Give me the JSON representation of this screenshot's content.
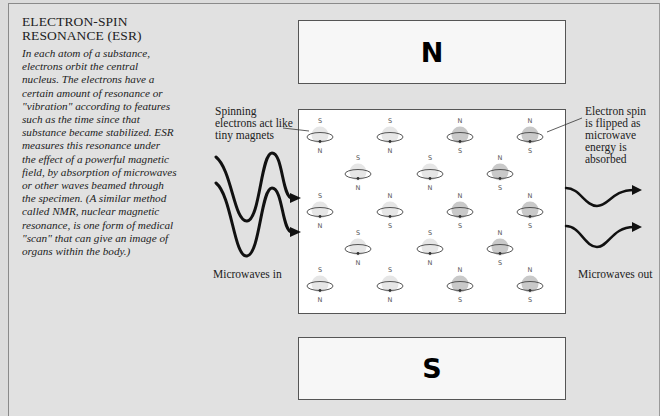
{
  "title": {
    "line1": "ELECTRON-SPIN",
    "line2": "RESONANCE (ESR)"
  },
  "description": [
    "In each atom of a substance,",
    "electrons orbit the central",
    "nucleus. The electrons have a",
    "certain amount of resonance or",
    "\"vibration\" according to features",
    "such as the time since that",
    "substance became stabilized. ESR",
    "measures this resonance under",
    "the effect of a powerful magnetic",
    "field, by absorption of microwaves",
    "or other waves beamed through",
    "the specimen. (A similar method",
    "called NMR, nuclear magnetic",
    "resonance, is one form of medical",
    "\"scan\" that can give an image of",
    "organs within the body.)"
  ],
  "magnets": {
    "top": "N",
    "bottom": "S"
  },
  "labels": {
    "spinning": [
      "Spinning",
      "electrons act like",
      "tiny magnets"
    ],
    "flipped": [
      "Electron spin",
      "is flipped as",
      "microwave",
      "energy is",
      "absorbed"
    ],
    "microwaves_in": "Microwaves in",
    "microwaves_out": "Microwaves out"
  },
  "electrons": [
    {
      "row": 1,
      "x": 320,
      "y": 135,
      "top": "S",
      "bottom": "N",
      "flipped": false
    },
    {
      "row": 1,
      "x": 390,
      "y": 135,
      "top": "S",
      "bottom": "N",
      "flipped": false
    },
    {
      "row": 1,
      "x": 460,
      "y": 135,
      "top": "N",
      "bottom": "S",
      "flipped": true
    },
    {
      "row": 1,
      "x": 530,
      "y": 135,
      "top": "N",
      "bottom": "S",
      "flipped": true
    },
    {
      "row": 2,
      "x": 358,
      "y": 172,
      "top": "S",
      "bottom": "N",
      "flipped": false
    },
    {
      "row": 2,
      "x": 430,
      "y": 172,
      "top": "S",
      "bottom": "N",
      "flipped": false
    },
    {
      "row": 2,
      "x": 500,
      "y": 172,
      "top": "N",
      "bottom": "S",
      "flipped": true
    },
    {
      "row": 3,
      "x": 320,
      "y": 210,
      "top": "S",
      "bottom": "N",
      "flipped": false
    },
    {
      "row": 3,
      "x": 390,
      "y": 210,
      "top": "N",
      "bottom": "S",
      "flipped": false
    },
    {
      "row": 3,
      "x": 460,
      "y": 210,
      "top": "N",
      "bottom": "S",
      "flipped": true
    },
    {
      "row": 3,
      "x": 530,
      "y": 210,
      "top": "N",
      "bottom": "S",
      "flipped": true
    },
    {
      "row": 4,
      "x": 358,
      "y": 247,
      "top": "S",
      "bottom": "N",
      "flipped": false
    },
    {
      "row": 4,
      "x": 430,
      "y": 247,
      "top": "S",
      "bottom": "N",
      "flipped": false
    },
    {
      "row": 4,
      "x": 500,
      "y": 247,
      "top": "N",
      "bottom": "S",
      "flipped": true
    },
    {
      "row": 5,
      "x": 320,
      "y": 284,
      "top": "S",
      "bottom": "N",
      "flipped": false
    },
    {
      "row": 5,
      "x": 390,
      "y": 284,
      "top": "S",
      "bottom": "N",
      "flipped": false
    },
    {
      "row": 5,
      "x": 460,
      "y": 284,
      "top": "N",
      "bottom": "S",
      "flipped": true
    },
    {
      "row": 5,
      "x": 530,
      "y": 284,
      "top": "N",
      "bottom": "S",
      "flipped": true
    }
  ],
  "colors": {
    "background": "#e1e1e1",
    "specimen": "#ffffff",
    "electron_normal": "#e6e6e6",
    "electron_flipped": "#c9c9c9",
    "wave": "#111111"
  }
}
